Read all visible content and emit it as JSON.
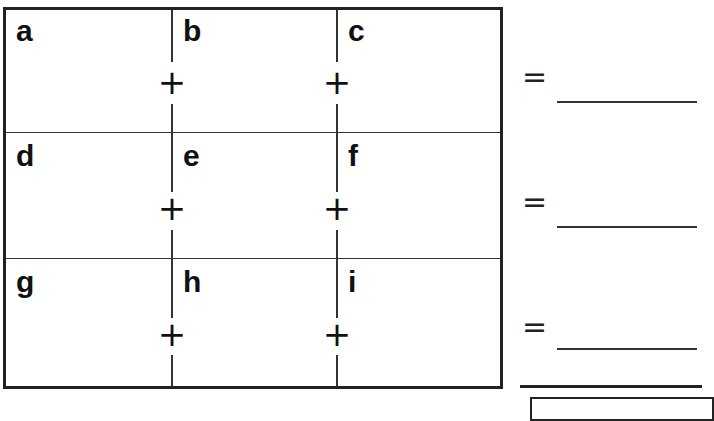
{
  "grid": {
    "rows": [
      {
        "cells": [
          "a",
          "b",
          "c"
        ],
        "operators": [
          "+",
          "+"
        ],
        "equals": "=",
        "answer": ""
      },
      {
        "cells": [
          "d",
          "e",
          "f"
        ],
        "operators": [
          "+",
          "+"
        ],
        "equals": "=",
        "answer": ""
      },
      {
        "cells": [
          "g",
          "h",
          "i"
        ],
        "operators": [
          "+",
          "+"
        ],
        "equals": "=",
        "answer": ""
      }
    ]
  },
  "total": {
    "answer": ""
  }
}
